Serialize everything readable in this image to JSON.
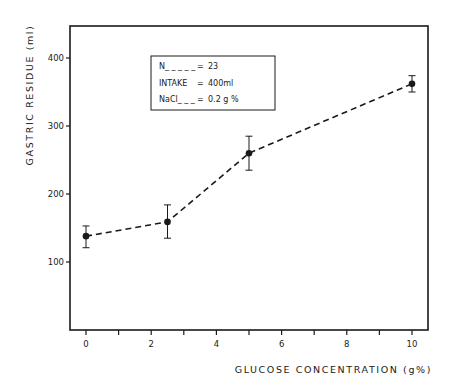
{
  "chart_data": {
    "type": "line",
    "title": "",
    "xlabel": "GLUCOSE  CONCENTRATION  (g%)",
    "ylabel": "GASTRIC  RESIDUE  (ml)",
    "xlim": [
      -0.5,
      10.5
    ],
    "ylim": [
      0,
      440
    ],
    "x_ticks": [
      0,
      1,
      2,
      3,
      4,
      5,
      6,
      7,
      8,
      9,
      10
    ],
    "x_tick_labels": [
      "0",
      "",
      "2",
      "",
      "4",
      "",
      "6",
      "",
      "8",
      "",
      "10"
    ],
    "y_ticks": [
      100,
      200,
      300,
      400
    ],
    "y_tick_labels": [
      "100",
      "200",
      "300",
      "400"
    ],
    "grid": false,
    "line_style": "dashed",
    "marker": "filled-circle",
    "series": [
      {
        "name": "Gastric residue",
        "x": [
          0,
          2.5,
          5,
          10
        ],
        "values": [
          138,
          159,
          260,
          362
        ],
        "error_upper": [
          153,
          184,
          285,
          374
        ],
        "error_lower": [
          121,
          135,
          235,
          350
        ]
      }
    ],
    "annotations": {
      "legend_box": [
        {
          "label": "N_ _ _ _ _",
          "eq": "=",
          "value": "23"
        },
        {
          "label": "INTAKE",
          "eq": "=",
          "value": "400ml"
        },
        {
          "label": "NaCl_ _ _",
          "eq": "=",
          "value": "0.2 g %"
        }
      ],
      "legend_position": "upper-left-inside"
    }
  },
  "labels": {
    "y_axis": "GASTRIC  RESIDUE  (ml)",
    "x_axis": "GLUCOSE  CONCENTRATION  (g%)",
    "legend_rows": [
      {
        "label": "N_ _ _ _ _",
        "eq": "=",
        "value": "23"
      },
      {
        "label": "INTAKE",
        "eq": "=",
        "value": "400ml"
      },
      {
        "label": "NaCl_ _ _",
        "eq": "=",
        "value": "0.2 g %"
      }
    ]
  },
  "colors": {
    "ink": "#1a1a1a",
    "background": "#ffffff"
  }
}
